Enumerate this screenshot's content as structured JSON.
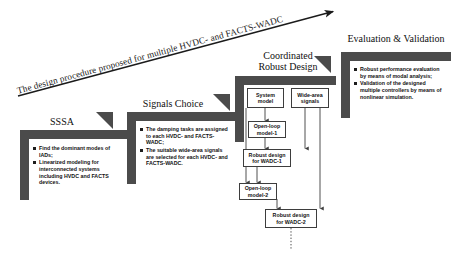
{
  "figure": {
    "arrow_caption": "The design procedure proposed for multiple HVDC- and FACTS-WADC",
    "accent_color": "#4b4b4b",
    "text_color": "#111111"
  },
  "stages": [
    {
      "id": "sssa",
      "title": "SSSA",
      "bullets": [
        "Find the dominant modes of IADs;",
        "Linearized modeling for interconnected systems including HVDC and FACTS devices."
      ]
    },
    {
      "id": "signals-choice",
      "title": "Signals Choice",
      "bullets": [
        "The damping tasks are assigned to each HVDC- and FACTS-WADC;",
        "The suitable wide-area signals are selected for each HVDC-  and FACTS-WADC."
      ]
    },
    {
      "id": "coordinated-robust-design",
      "title_line1": "Coordinated",
      "title_line2": "Robust Design",
      "bullets": []
    },
    {
      "id": "evaluation-validation",
      "title": "Evaluation & Validation",
      "bullets": [
        "Robust performance evaluation by means of modal analysis;",
        "Validation of the designed multiple controllers by means of nonlinear simulation."
      ]
    }
  ],
  "flowchart": {
    "boxes": [
      {
        "id": "system-model",
        "line1": "System",
        "line2": "model"
      },
      {
        "id": "wide-area-signals",
        "line1": "Wide-area",
        "line2": "signals"
      },
      {
        "id": "open-loop-model-1",
        "line1": "Open-loop",
        "line2": "model-1"
      },
      {
        "id": "robust-design-wadc-1",
        "line1": "Robust design",
        "line2": "for WADC-1"
      },
      {
        "id": "open-loop-model-2",
        "line1": "Open-loop",
        "line2": "model-2"
      },
      {
        "id": "robust-design-wadc-2",
        "line1": "Robust design",
        "line2": "for  WADC-2"
      }
    ]
  }
}
